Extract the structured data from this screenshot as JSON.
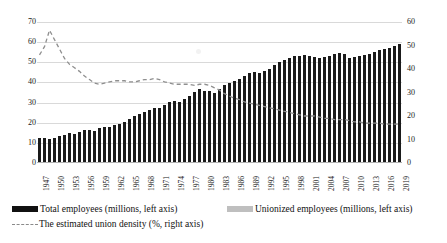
{
  "chart_data": {
    "type": "bar",
    "title": "",
    "subtitle": "",
    "xlabel": "",
    "ylabel": "",
    "y2label": "",
    "ylim": [
      0,
      70
    ],
    "y2lim": [
      0,
      60
    ],
    "yticks": [
      0,
      10,
      20,
      30,
      40,
      50,
      60,
      70
    ],
    "y2ticks": [
      0,
      10,
      20,
      30,
      40,
      50,
      60
    ],
    "grid": true,
    "legend_position": "bottom",
    "tick_label_step": 3,
    "x": [
      1947,
      1948,
      1949,
      1950,
      1951,
      1952,
      1953,
      1954,
      1955,
      1956,
      1957,
      1958,
      1959,
      1960,
      1961,
      1962,
      1963,
      1964,
      1965,
      1966,
      1967,
      1968,
      1969,
      1970,
      1971,
      1972,
      1973,
      1974,
      1975,
      1976,
      1977,
      1978,
      1979,
      1980,
      1981,
      1982,
      1983,
      1984,
      1985,
      1986,
      1987,
      1988,
      1989,
      1990,
      1991,
      1992,
      1993,
      1994,
      1995,
      1996,
      1997,
      1998,
      1999,
      2000,
      2001,
      2002,
      2003,
      2004,
      2005,
      2006,
      2007,
      2008,
      2009,
      2010,
      2011,
      2012,
      2013,
      2014,
      2015,
      2016,
      2017,
      2018,
      2019
    ],
    "xtick_labels": [
      "1947",
      "1950",
      "1953",
      "1956",
      "1959",
      "1962",
      "1965",
      "1968",
      "1971",
      "1974",
      "1977",
      "1980",
      "1983",
      "1986",
      "1989",
      "1992",
      "1995",
      "1998",
      "2001",
      "2004",
      "2007",
      "2010",
      "2013",
      "2016",
      "2019"
    ],
    "series": [
      {
        "name": "Total employees (millions, left axis)",
        "axis": "left",
        "kind": "bar",
        "color": "#1a1a1a",
        "values": [
          12.5,
          12.5,
          12.0,
          12.5,
          13.5,
          14.0,
          15.0,
          14.5,
          15.5,
          16.5,
          16.5,
          16.0,
          17.5,
          18.0,
          18.0,
          19.0,
          19.5,
          20.5,
          22.0,
          23.5,
          24.5,
          25.5,
          26.5,
          27.5,
          27.5,
          29.0,
          30.5,
          31.0,
          30.5,
          32.0,
          33.5,
          35.5,
          36.5,
          36.0,
          36.0,
          35.0,
          36.5,
          38.5,
          39.5,
          40.5,
          41.5,
          43.0,
          44.5,
          45.0,
          44.5,
          45.5,
          46.5,
          48.5,
          50.0,
          51.0,
          52.0,
          53.0,
          53.0,
          53.5,
          53.0,
          52.5,
          52.0,
          52.5,
          53.0,
          54.0,
          54.5,
          54.0,
          52.0,
          52.5,
          53.0,
          53.5,
          54.0,
          55.0,
          56.0,
          56.5,
          57.0,
          58.0,
          59.0
        ]
      },
      {
        "name": "Unionized employees (millions, left axis)",
        "axis": "left",
        "kind": "bar",
        "color": "#b8b8b8",
        "values": [
          6.5,
          7.0,
          7.0,
          7.0,
          7.5,
          8.0,
          8.5,
          8.5,
          8.5,
          8.5,
          8.5,
          8.5,
          8.5,
          8.5,
          8.5,
          8.5,
          8.5,
          8.5,
          9.0,
          9.5,
          10.0,
          10.0,
          10.0,
          10.5,
          10.5,
          10.5,
          10.5,
          11.0,
          11.0,
          11.0,
          11.0,
          11.0,
          11.0,
          11.0,
          11.0,
          10.5,
          10.5,
          10.5,
          10.5,
          10.0,
          10.0,
          10.0,
          10.0,
          10.0,
          9.5,
          9.5,
          9.5,
          9.5,
          9.5,
          9.5,
          9.5,
          9.5,
          9.5,
          9.5,
          9.5,
          9.0,
          9.0,
          9.0,
          9.0,
          9.0,
          9.0,
          9.0,
          8.5,
          8.5,
          8.5,
          8.5,
          8.5,
          8.5,
          8.5,
          8.5,
          8.5,
          8.5,
          8.5
        ]
      },
      {
        "name": "The estimated union density (%, right axis)",
        "axis": "right",
        "kind": "line",
        "style": "dashed",
        "color": "#8f8f8f",
        "values": [
          46.0,
          49.5,
          56.5,
          52.5,
          48.5,
          44.5,
          42.0,
          40.5,
          39.0,
          37.0,
          35.5,
          34.0,
          33.5,
          34.0,
          34.5,
          35.0,
          35.0,
          35.0,
          34.5,
          34.5,
          35.0,
          35.5,
          35.5,
          36.0,
          35.5,
          34.5,
          34.0,
          33.5,
          33.5,
          33.5,
          33.5,
          33.0,
          33.5,
          33.5,
          33.0,
          32.0,
          31.0,
          29.5,
          28.5,
          27.5,
          27.0,
          26.0,
          25.5,
          25.0,
          24.5,
          24.0,
          23.5,
          23.0,
          22.5,
          22.0,
          21.5,
          21.0,
          20.5,
          20.0,
          20.0,
          20.0,
          19.5,
          19.0,
          19.0,
          18.5,
          18.5,
          18.5,
          18.0,
          17.5,
          17.5,
          17.0,
          17.0,
          17.0,
          17.0,
          16.5,
          16.5,
          16.5,
          16.5
        ]
      }
    ],
    "legend": [
      {
        "id": "total",
        "label": "Total employees (millions, left axis)",
        "marker": "bar",
        "color": "#111111"
      },
      {
        "id": "union",
        "label": "Unionized employees (millions, left axis)",
        "marker": "bar",
        "color": "#bfbfbf"
      },
      {
        "id": "density",
        "label": "The estimated union density (%, right axis)",
        "marker": "dashed-line",
        "color": "#8a8a8a"
      }
    ]
  }
}
